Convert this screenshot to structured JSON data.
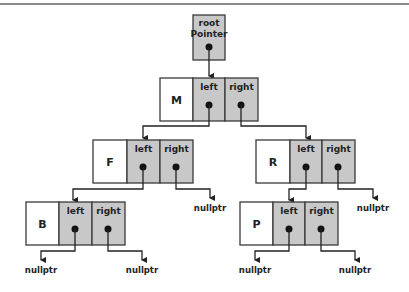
{
  "diagram": {
    "colors": {
      "pointer_cell": "#c8c8c8",
      "key_cell": "#ffffff",
      "stroke": "#3a3a3a",
      "dot": "#111111",
      "rule": "#8a8a8a"
    },
    "root": {
      "label_line1": "root",
      "label_line2": "Pointer"
    },
    "field_labels": {
      "left": "left",
      "right": "right"
    },
    "null_label": "nullptr",
    "nodes": [
      {
        "id": "M",
        "key": "M",
        "level": 1,
        "left": "F",
        "right": "R"
      },
      {
        "id": "F",
        "key": "F",
        "level": 2,
        "left": "B",
        "right": "nullptr"
      },
      {
        "id": "R",
        "key": "R",
        "level": 2,
        "left": "P",
        "right": "nullptr"
      },
      {
        "id": "B",
        "key": "B",
        "level": 3,
        "left": "nullptr",
        "right": "nullptr"
      },
      {
        "id": "P",
        "key": "P",
        "level": 3,
        "left": "nullptr",
        "right": "nullptr"
      }
    ],
    "null_pointers": [
      {
        "from": "F.right",
        "label": "nullptr"
      },
      {
        "from": "R.right",
        "label": "nullptr"
      },
      {
        "from": "B.left",
        "label": "nullptr"
      },
      {
        "from": "B.right",
        "label": "nullptr"
      },
      {
        "from": "P.left",
        "label": "nullptr"
      },
      {
        "from": "P.right",
        "label": "nullptr"
      }
    ]
  }
}
